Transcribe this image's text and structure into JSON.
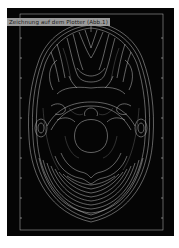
{
  "figure": {
    "label": "Zeichnung auf dem Plotter (Abb.1)",
    "caption": "",
    "background_color": "#050505",
    "line_color": "#d9d9d9",
    "label_bg_color": "#9a9a9a"
  }
}
